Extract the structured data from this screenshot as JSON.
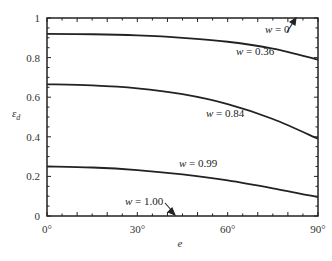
{
  "chart_data": {
    "type": "line",
    "title": "",
    "xlabel": "e",
    "ylabel": "ε_d",
    "xlim": [
      0,
      90
    ],
    "ylim": [
      0,
      1
    ],
    "x_ticks": [
      "0°",
      "30°",
      "60°",
      "90°"
    ],
    "y_ticks": [
      "0",
      "0.2",
      "0.4",
      "0.6",
      "0.8",
      "1"
    ],
    "grid": false,
    "legend": "inline labels",
    "series": [
      {
        "name": "w = 0",
        "x": [
          0,
          15,
          30,
          45,
          60,
          75,
          90
        ],
        "values": [
          1.0,
          1.0,
          1.0,
          1.0,
          1.0,
          1.0,
          1.0
        ]
      },
      {
        "name": "w = 0.36",
        "x": [
          0,
          15,
          30,
          45,
          60,
          75,
          90
        ],
        "values": [
          0.92,
          0.918,
          0.912,
          0.9,
          0.88,
          0.845,
          0.79
        ]
      },
      {
        "name": "w = 0.84",
        "x": [
          0,
          15,
          30,
          45,
          60,
          75,
          90
        ],
        "values": [
          0.665,
          0.66,
          0.645,
          0.615,
          0.565,
          0.49,
          0.39
        ]
      },
      {
        "name": "w = 0.99",
        "x": [
          0,
          15,
          30,
          45,
          60,
          75,
          90
        ],
        "values": [
          0.25,
          0.245,
          0.232,
          0.21,
          0.18,
          0.14,
          0.095
        ]
      },
      {
        "name": "w = 1.00",
        "x": [
          0,
          15,
          30,
          45,
          60,
          75,
          90
        ],
        "values": [
          0,
          0,
          0,
          0,
          0,
          0,
          0
        ]
      }
    ],
    "annotations": [
      {
        "text": "w = 0",
        "arrow_to": "top axis near e≈88°"
      },
      {
        "text": "w = 0.36"
      },
      {
        "text": "w = 0.84"
      },
      {
        "text": "w = 0.99"
      },
      {
        "text": "w = 1.00",
        "arrow_to": "bottom axis near e≈42°"
      }
    ]
  },
  "labels": {
    "w0": {
      "var": "w",
      "eq": " = 0"
    },
    "w036": {
      "var": "w",
      "eq": " = 0.36"
    },
    "w084": {
      "var": "w",
      "eq": " = 0.84"
    },
    "w099": {
      "var": "w",
      "eq": " = 0.99"
    },
    "w100": {
      "var": "w",
      "eq": " = 1.00"
    }
  },
  "axes": {
    "x_title": "e",
    "y_title_main": "ε",
    "y_title_sub": "d"
  }
}
